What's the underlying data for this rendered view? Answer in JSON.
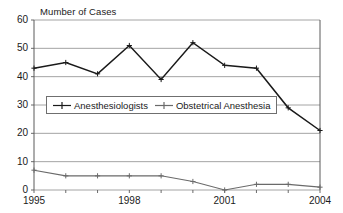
{
  "chart_data": {
    "type": "line",
    "title": "",
    "clipped_header": "",
    "axis_caption": "Mumber of Cases",
    "xlabel": "",
    "ylabel": "",
    "x": [
      1995,
      1996,
      1997,
      1998,
      1999,
      2000,
      2001,
      2002,
      2003,
      2004
    ],
    "categories": [
      "1995",
      "1996",
      "1997",
      "1998",
      "1999",
      "2000",
      "2001",
      "2002",
      "2003",
      "2004"
    ],
    "xtick_labels": [
      "1995",
      "1998",
      "2001",
      "2004"
    ],
    "xtick_values": [
      1995,
      1998,
      2001,
      2004
    ],
    "ytick_labels": [
      "0",
      "10",
      "20",
      "30",
      "40",
      "50",
      "60"
    ],
    "ytick_values": [
      0,
      10,
      20,
      30,
      40,
      50,
      60
    ],
    "ylim": [
      0,
      60
    ],
    "xlim": [
      1995,
      2004
    ],
    "grid": "horizontal",
    "legend_position": "inside-center-left",
    "series": [
      {
        "name": "Anesthesiologists",
        "values": [
          43,
          45,
          41,
          51,
          39,
          52,
          44,
          43,
          29,
          21
        ],
        "color": "#1a1a1a",
        "marker": "plus"
      },
      {
        "name": "Obstetrical Anesthesia",
        "values": [
          7,
          5,
          5,
          5,
          5,
          3,
          0,
          2,
          2,
          1
        ],
        "color": "#6a6a6a",
        "marker": "plus"
      }
    ]
  },
  "legend": {
    "items": [
      {
        "label": "Anesthesiologists"
      },
      {
        "label": "Obstetrical Anesthesia"
      }
    ]
  },
  "colors": {
    "series_primary": "#1a1a1a",
    "series_secondary": "#6a6a6a",
    "gridline": "#9a9a9a",
    "axis": "#5a5a5a",
    "background": "#ffffff"
  }
}
